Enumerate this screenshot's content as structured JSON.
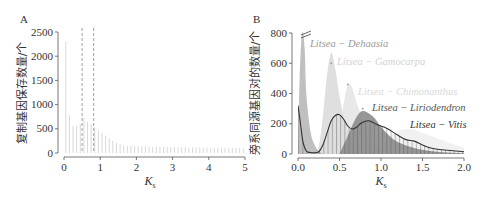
{
  "chart_data": [
    {
      "panel": "A",
      "type": "bar",
      "xlabel": "Ks",
      "ylabel": "复制基因保存数量/个",
      "xlim": [
        0,
        5
      ],
      "ylim": [
        0,
        2500
      ],
      "xticks": [
        "0",
        "1",
        "2",
        "3",
        "4",
        "5"
      ],
      "yticks": [
        "0",
        "500",
        "1000",
        "1500",
        "2000",
        "2500"
      ],
      "reference_lines": [
        0.5,
        0.82
      ],
      "bin_width": 0.1,
      "x": [
        0.05,
        0.15,
        0.25,
        0.35,
        0.45,
        0.55,
        0.65,
        0.75,
        0.85,
        0.95,
        1.05,
        1.15,
        1.25,
        1.35,
        1.45,
        1.55,
        1.65,
        1.75,
        1.85,
        1.95,
        2.05,
        2.15,
        2.25,
        2.35,
        2.45,
        2.55,
        2.65,
        2.75,
        2.85,
        2.95,
        3.05,
        3.15,
        3.25,
        3.35,
        3.45,
        3.55,
        3.65,
        3.75,
        3.85,
        3.95,
        4.05,
        4.15,
        4.25,
        4.35,
        4.45,
        4.55,
        4.65,
        4.75,
        4.85,
        4.95
      ],
      "values": [
        2300,
        780,
        560,
        560,
        600,
        720,
        640,
        600,
        520,
        470,
        420,
        360,
        300,
        250,
        210,
        180,
        160,
        150,
        145,
        140,
        140,
        135,
        135,
        130,
        130,
        130,
        125,
        125,
        125,
        120,
        120,
        120,
        118,
        118,
        115,
        115,
        112,
        112,
        110,
        110,
        108,
        108,
        105,
        105,
        102,
        100,
        100,
        98,
        96,
        95
      ]
    },
    {
      "panel": "B",
      "type": "area",
      "xlabel": "Ks",
      "ylabel": "旁系同源基因对的数量/个",
      "xlim": [
        0,
        2.0
      ],
      "ylim": [
        0,
        800
      ],
      "xticks": [
        "0.0",
        "0.5",
        "1.0",
        "1.5",
        "2.0"
      ],
      "yticks": [
        "0",
        "200",
        "400",
        "600",
        "800"
      ],
      "axis_break": "y-top",
      "series": [
        {
          "name": "Litsea - Dehaasia",
          "color": "#b8b8b8",
          "peak_x": 0.05,
          "peak_y": 800,
          "x": [
            0.0,
            0.02,
            0.05,
            0.08,
            0.1,
            0.15,
            0.2,
            0.25,
            0.3
          ],
          "y": [
            0,
            500,
            800,
            700,
            400,
            150,
            60,
            20,
            0
          ]
        },
        {
          "name": "Litsea - Gamocarpa",
          "color": "#dcdcdc",
          "peak_x": 0.4,
          "peak_y": 670,
          "x": [
            0.2,
            0.25,
            0.3,
            0.35,
            0.4,
            0.45,
            0.5,
            0.55,
            0.6,
            0.7
          ],
          "y": [
            0,
            50,
            250,
            520,
            670,
            560,
            380,
            250,
            150,
            0
          ]
        },
        {
          "name": "Litsea - Chimonanthus",
          "color": "#e6e6e6",
          "peak_x": 0.62,
          "peak_y": 470,
          "x": [
            0.4,
            0.5,
            0.55,
            0.6,
            0.65,
            0.7,
            0.8,
            0.9,
            1.0
          ],
          "y": [
            0,
            150,
            330,
            460,
            440,
            350,
            200,
            80,
            0
          ]
        },
        {
          "name": "Litsea - Liriodendron",
          "color": "#8c8c8c",
          "peak_x": 0.78,
          "peak_y": 290,
          "x": [
            0.5,
            0.6,
            0.7,
            0.78,
            0.9,
            1.0,
            1.1,
            1.2,
            1.4,
            1.6,
            1.8,
            2.0
          ],
          "y": [
            0,
            120,
            240,
            285,
            250,
            180,
            120,
            80,
            40,
            20,
            10,
            5
          ]
        },
        {
          "name": "Litsea - Vitis",
          "color": "#efefef",
          "peak_x": 1.3,
          "peak_y": 165,
          "x": [
            0.8,
            1.0,
            1.1,
            1.2,
            1.3,
            1.4,
            1.5,
            1.6,
            1.7,
            1.8,
            1.9,
            2.0
          ],
          "y": [
            0,
            60,
            110,
            150,
            165,
            160,
            140,
            120,
            100,
            80,
            60,
            40
          ]
        },
        {
          "name": "Litsea intra-species curve",
          "color": "#333333",
          "style": "line-hatched",
          "x": [
            0.0,
            0.03,
            0.06,
            0.1,
            0.15,
            0.2,
            0.25,
            0.3,
            0.35,
            0.4,
            0.45,
            0.5,
            0.55,
            0.6,
            0.65,
            0.7,
            0.75,
            0.8,
            0.85,
            0.9,
            0.95,
            1.0,
            1.05,
            1.1,
            1.2,
            1.3,
            1.4,
            1.5,
            1.6,
            1.7,
            1.8,
            1.9,
            2.0
          ],
          "y": [
            320,
            200,
            80,
            20,
            10,
            8,
            15,
            60,
            140,
            220,
            255,
            260,
            230,
            185,
            165,
            175,
            200,
            215,
            220,
            210,
            195,
            185,
            175,
            160,
            125,
            95,
            85,
            60,
            40,
            30,
            25,
            20,
            15
          ]
        }
      ]
    }
  ],
  "panels": {
    "a": {
      "label": "A",
      "ylabel": "复制基因保存数量/个",
      "xlabel_main": "K",
      "xlabel_sub": "s"
    },
    "b": {
      "label": "B",
      "ylabel": "旁系同源基因对的数量/个",
      "xlabel_main": "K",
      "xlabel_sub": "s",
      "annotations": {
        "dehaasia": "Litsea − Dehaasia",
        "gamocarpa": "Litsea − Gamocarpa",
        "chimonanthus": "Litsea − Chimonanthus",
        "liriodendron": "Litsea − Liriodendron",
        "vitis": "Litsea − Vitis"
      }
    }
  }
}
